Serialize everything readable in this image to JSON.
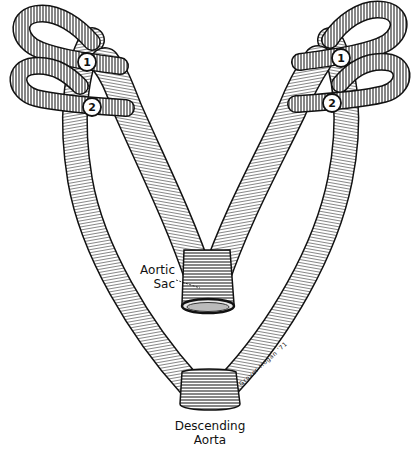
{
  "figure": {
    "labels": {
      "aortic_sac": [
        "Aortic",
        "Sac"
      ],
      "descending_aorta": [
        "Descending",
        "Aorta"
      ]
    },
    "arch_markers": [
      {
        "side": "left",
        "number": "1"
      },
      {
        "side": "left",
        "number": "2"
      },
      {
        "side": "right",
        "number": "1"
      },
      {
        "side": "right",
        "number": "2"
      }
    ],
    "signature": "Grover Hogan '71"
  },
  "colors": {
    "ink": "#111111",
    "background": "#ffffff"
  }
}
